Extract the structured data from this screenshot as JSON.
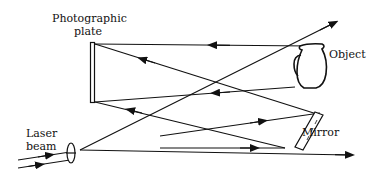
{
  "diagram": {
    "title": "",
    "labels": {
      "plate_line1": "Photographic",
      "plate_line2": "plate",
      "object": "Object",
      "mirror": "Mirror",
      "laser_line1": "Laser",
      "laser_line2": "beam"
    },
    "colors": {
      "ink": "#111111",
      "background": "#ffffff"
    }
  }
}
